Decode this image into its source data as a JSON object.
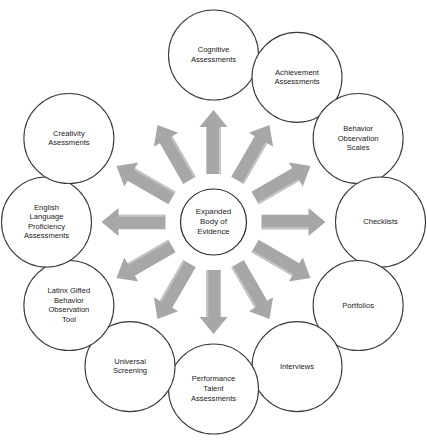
{
  "diagram": {
    "type": "radial-hub-and-spoke",
    "background_color": "#ffffff",
    "arrow_color": "#a7a7a7",
    "arrow_highlight_color": "#c4c4c4",
    "circle_stroke_color": "#3c3c3c",
    "arrow_count": 12,
    "hub": {
      "name": "expanded-body-of-evidence",
      "lines": [
        "Expanded",
        "Body of",
        "Evidence"
      ],
      "text": "Expanded Body of Evidence"
    },
    "nodes": [
      {
        "name": "cognitive-assessments",
        "lines": [
          "Cognitive",
          "Assessments"
        ],
        "text": "Cognitive Assessments"
      },
      {
        "name": "achievement-assessments",
        "lines": [
          "Achievement",
          "Assessments"
        ],
        "text": "Achievement Assessments"
      },
      {
        "name": "behavior-observation-scales",
        "lines": [
          "Behavior",
          "Observation",
          "Scales"
        ],
        "text": "Behavior Observation Scales"
      },
      {
        "name": "checklists",
        "lines": [
          "Checklists"
        ],
        "text": "Checklists"
      },
      {
        "name": "portfolios",
        "lines": [
          "Portfolios"
        ],
        "text": "Portfolios"
      },
      {
        "name": "interviews",
        "lines": [
          "Interviews"
        ],
        "text": "Interviews"
      },
      {
        "name": "performance-talent-assessments",
        "lines": [
          "Performance",
          "Talent",
          "Assessments"
        ],
        "text": "Performance Talent Assessments"
      },
      {
        "name": "universal-screening",
        "lines": [
          "Universal",
          "Screening"
        ],
        "text": "Universal Screening"
      },
      {
        "name": "latinx-gifted-behavior-observation-tool",
        "lines": [
          "Latinx Gifted",
          "Behavior",
          "Observation",
          "Tool"
        ],
        "text": "Latinx Gifted Behavior Observation Tool"
      },
      {
        "name": "english-language-proficiency-assessments",
        "lines": [
          "English",
          "Language",
          "Proficiency",
          "Assessments"
        ],
        "text": "English Language Proficiency Assessments"
      },
      {
        "name": "creativity-asessments",
        "lines": [
          "Creativity",
          "Asessments"
        ],
        "text": "Creativity Asessments"
      }
    ],
    "layout": {
      "center_x": 213.5,
      "center_y": 222,
      "node_ring_radius": 167,
      "node_radius": 45,
      "hub_radius": 33,
      "arrow_inner_radius": 48,
      "arrow_outer_radius": 112,
      "node_angles_deg": [
        -90,
        -60,
        -30,
        0,
        30,
        60,
        90,
        120,
        150,
        180,
        210
      ],
      "arrow_angles_deg": [
        -90,
        -60,
        -30,
        0,
        30,
        60,
        90,
        120,
        150,
        180,
        210,
        240
      ]
    }
  }
}
